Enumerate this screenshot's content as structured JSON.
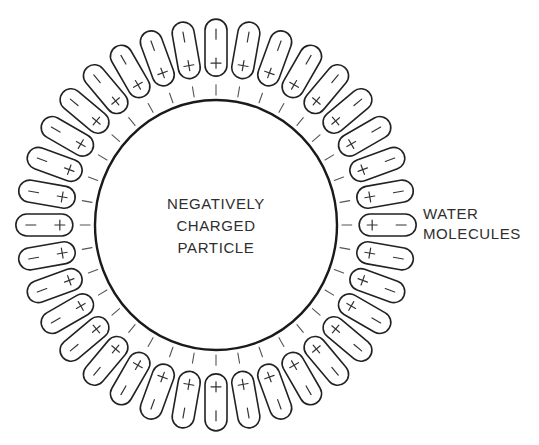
{
  "diagram": {
    "particle": {
      "label_lines": [
        "NEGATIVELY",
        "CHARGED",
        "PARTICLE"
      ],
      "charge_sign": "−",
      "center": [
        216,
        225
      ],
      "rx": 121,
      "ry": 125
    },
    "water_molecules": {
      "label_lines": [
        "WATER",
        "MOLECULES"
      ],
      "count": 36,
      "angle_step_deg": 10,
      "inner_radius": 146,
      "outer_radius": 203,
      "width": 22,
      "positive_sign": "+",
      "negative_sign": "−",
      "positive_end": "inner",
      "negative_end": "outer"
    },
    "surface_ticks": {
      "inner_radius": 128,
      "outer_radius": 138
    },
    "colors": {
      "stroke": "#1a1a1a",
      "text": "#2e2e2e",
      "background": "#ffffff"
    }
  }
}
